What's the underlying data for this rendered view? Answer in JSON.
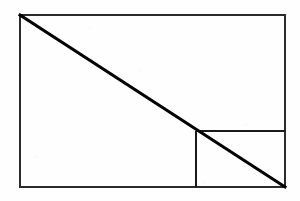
{
  "figure": {
    "title": "Geometric construction: rectangle with diagonal and nested sub-rectangle",
    "canvas": {
      "width": 300,
      "height": 201,
      "background_color": "#fefefe"
    },
    "colors": {
      "stroke": "#1a1a1a",
      "border_stroke": "#2b2b2b",
      "diagonal_stroke": "#000000",
      "background": "#fefefe"
    },
    "stroke_widths": {
      "outer_rectangle": 1.6,
      "inner_line": 1.6,
      "diagonal": 3.0
    },
    "outer_rectangle": {
      "label": "outer-rectangle",
      "x": 20,
      "y": 15,
      "width": 265,
      "height": 172,
      "right": 285,
      "bottom": 187
    },
    "diagonal": {
      "label": "main-diagonal",
      "x1": 20,
      "y1": 15,
      "x2": 285,
      "y2": 187
    },
    "intersection_point": {
      "label": "diagonal-intersection",
      "x": 196,
      "y": 131
    },
    "inner_vertical_line": {
      "label": "inner-vertical-line",
      "x1": 196,
      "y1": 131,
      "x2": 196,
      "y2": 187
    },
    "inner_horizontal_line": {
      "label": "inner-horizontal-line",
      "x1": 196,
      "y1": 131,
      "x2": 285,
      "y2": 131
    },
    "sub_rectangle": {
      "label": "nested-sub-rectangle",
      "x": 196,
      "y": 131,
      "width": 89,
      "height": 56
    }
  }
}
